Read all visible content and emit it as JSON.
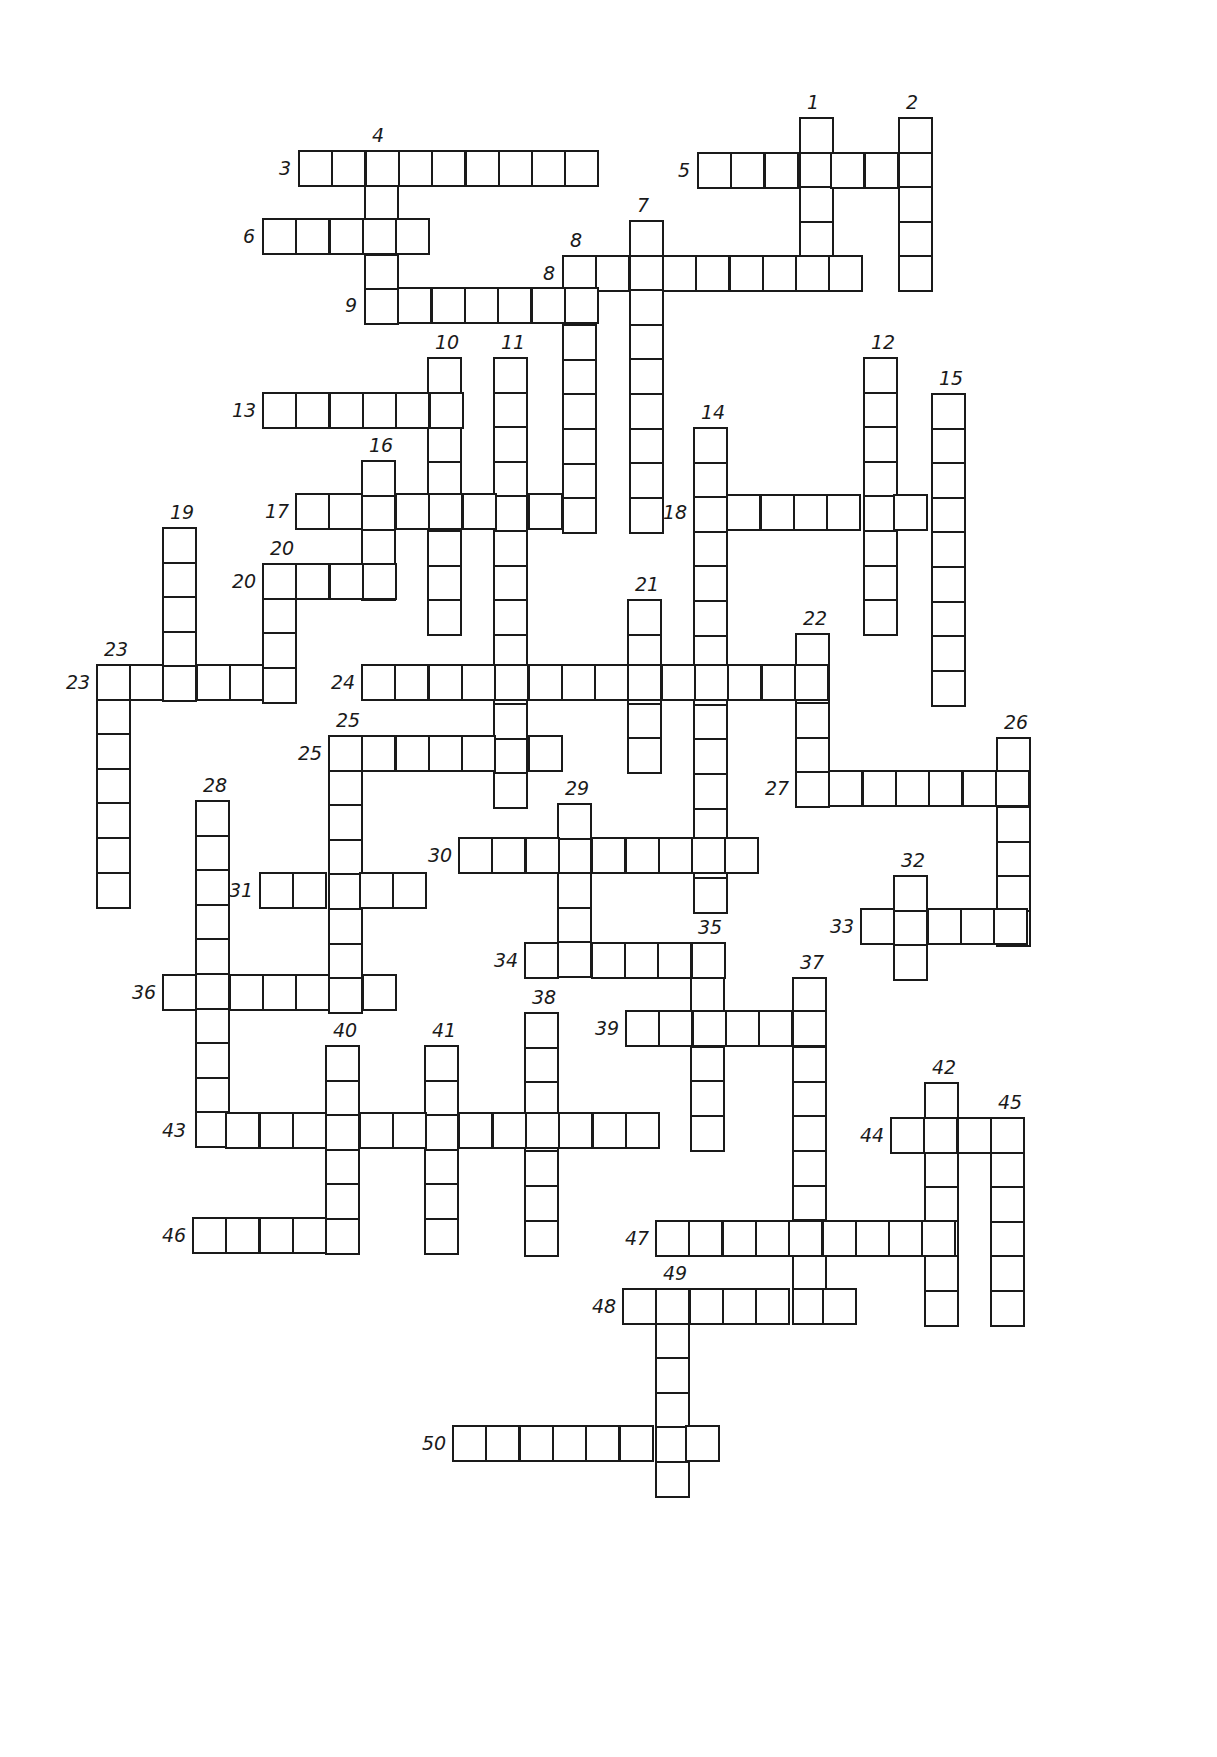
{
  "puzzle": {
    "type": "crossword",
    "cell_w": 33.3,
    "cell_h": 34.6,
    "line_color": "#1a1a1a",
    "background": "#ffffff",
    "words": [
      {
        "num": "1",
        "dir": "down",
        "x": 799,
        "y": 117,
        "len": 5
      },
      {
        "num": "2",
        "dir": "down",
        "x": 898,
        "y": 117,
        "len": 5
      },
      {
        "num": "3",
        "dir": "across",
        "x": 298,
        "y": 150,
        "len": 9
      },
      {
        "num": "4",
        "dir": "down",
        "x": 364,
        "y": 150,
        "len": 5
      },
      {
        "num": "5",
        "dir": "across",
        "x": 697,
        "y": 152,
        "len": 7
      },
      {
        "num": "6",
        "dir": "across",
        "x": 262,
        "y": 218,
        "len": 5
      },
      {
        "num": "7",
        "dir": "down",
        "x": 629,
        "y": 220,
        "len": 9
      },
      {
        "num": "8",
        "dir": "across",
        "x": 562,
        "y": 255,
        "len": 9
      },
      {
        "num": "8",
        "dir": "down",
        "x": 562,
        "y": 255,
        "len": 8
      },
      {
        "num": "9",
        "dir": "across",
        "x": 364,
        "y": 287,
        "len": 7
      },
      {
        "num": "10",
        "dir": "down",
        "x": 427,
        "y": 357,
        "len": 8
      },
      {
        "num": "11",
        "dir": "down",
        "x": 493,
        "y": 357,
        "len": 13
      },
      {
        "num": "12",
        "dir": "down",
        "x": 863,
        "y": 357,
        "len": 8
      },
      {
        "num": "13",
        "dir": "across",
        "x": 262,
        "y": 392,
        "len": 6
      },
      {
        "num": "14",
        "dir": "down",
        "x": 693,
        "y": 427,
        "len": 14
      },
      {
        "num": "15",
        "dir": "down",
        "x": 931,
        "y": 393,
        "len": 9
      },
      {
        "num": "16",
        "dir": "down",
        "x": 361,
        "y": 460,
        "len": 4
      },
      {
        "num": "17",
        "dir": "across",
        "x": 295,
        "y": 493,
        "len": 9
      },
      {
        "num": "18",
        "dir": "across",
        "x": 693,
        "y": 494,
        "len": 8
      },
      {
        "num": "19",
        "dir": "down",
        "x": 162,
        "y": 527,
        "len": 5
      },
      {
        "num": "20",
        "dir": "across",
        "x": 262,
        "y": 563,
        "len": 4
      },
      {
        "num": "20",
        "dir": "down",
        "x": 262,
        "y": 563,
        "len": 4
      },
      {
        "num": "21",
        "dir": "down",
        "x": 627,
        "y": 599,
        "len": 5
      },
      {
        "num": "22",
        "dir": "down",
        "x": 795,
        "y": 633,
        "len": 5
      },
      {
        "num": "23",
        "dir": "across",
        "x": 96,
        "y": 664,
        "len": 6
      },
      {
        "num": "23",
        "dir": "down",
        "x": 96,
        "y": 664,
        "len": 7
      },
      {
        "num": "24",
        "dir": "across",
        "x": 361,
        "y": 664,
        "len": 14
      },
      {
        "num": "25",
        "dir": "across",
        "x": 328,
        "y": 735,
        "len": 7
      },
      {
        "num": "25",
        "dir": "down",
        "x": 328,
        "y": 735,
        "len": 8
      },
      {
        "num": "26",
        "dir": "down",
        "x": 996,
        "y": 737,
        "len": 6
      },
      {
        "num": "27",
        "dir": "across",
        "x": 795,
        "y": 770,
        "len": 7
      },
      {
        "num": "28",
        "dir": "down",
        "x": 195,
        "y": 800,
        "len": 10
      },
      {
        "num": "29",
        "dir": "down",
        "x": 557,
        "y": 803,
        "len": 5
      },
      {
        "num": "30",
        "dir": "across",
        "x": 458,
        "y": 837,
        "len": 9
      },
      {
        "num": "31",
        "dir": "across",
        "x": 259,
        "y": 872,
        "len": 5
      },
      {
        "num": "32",
        "dir": "down",
        "x": 893,
        "y": 875,
        "len": 3
      },
      {
        "num": "33",
        "dir": "across",
        "x": 860,
        "y": 908,
        "len": 5
      },
      {
        "num": "34",
        "dir": "across",
        "x": 524,
        "y": 942,
        "len": 6
      },
      {
        "num": "35",
        "dir": "down",
        "x": 690,
        "y": 942,
        "len": 6
      },
      {
        "num": "36",
        "dir": "across",
        "x": 162,
        "y": 974,
        "len": 7
      },
      {
        "num": "37",
        "dir": "down",
        "x": 792,
        "y": 977,
        "len": 10
      },
      {
        "num": "38",
        "dir": "down",
        "x": 524,
        "y": 1012,
        "len": 7
      },
      {
        "num": "39",
        "dir": "across",
        "x": 625,
        "y": 1010,
        "len": 6
      },
      {
        "num": "40",
        "dir": "down",
        "x": 325,
        "y": 1045,
        "len": 6
      },
      {
        "num": "41",
        "dir": "down",
        "x": 424,
        "y": 1045,
        "len": 6
      },
      {
        "num": "42",
        "dir": "down",
        "x": 924,
        "y": 1082,
        "len": 7
      },
      {
        "num": "43",
        "dir": "across",
        "x": 192,
        "y": 1112,
        "len": 14
      },
      {
        "num": "44",
        "dir": "across",
        "x": 890,
        "y": 1117,
        "len": 4
      },
      {
        "num": "45",
        "dir": "down",
        "x": 990,
        "y": 1117,
        "len": 6
      },
      {
        "num": "46",
        "dir": "across",
        "x": 192,
        "y": 1217,
        "len": 5
      },
      {
        "num": "47",
        "dir": "across",
        "x": 655,
        "y": 1220,
        "len": 9
      },
      {
        "num": "48",
        "dir": "across",
        "x": 622,
        "y": 1288,
        "len": 7
      },
      {
        "num": "49",
        "dir": "down",
        "x": 655,
        "y": 1288,
        "len": 6
      },
      {
        "num": "50",
        "dir": "across",
        "x": 452,
        "y": 1425,
        "len": 8
      }
    ]
  }
}
